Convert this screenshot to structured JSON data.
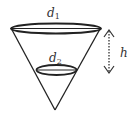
{
  "diagram": {
    "type": "cone-cross-section",
    "labels": {
      "top_diameter": "d",
      "top_diameter_sub": "1",
      "inner_diameter": "d",
      "inner_diameter_sub": "2",
      "height": "h"
    },
    "colors": {
      "stroke": "#222222",
      "text": "#333333",
      "background": "#ffffff"
    }
  }
}
